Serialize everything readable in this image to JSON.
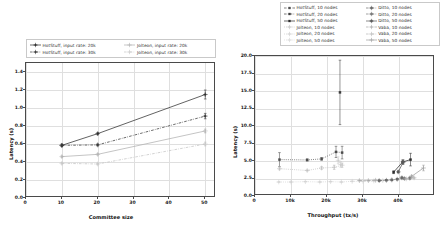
{
  "figure": {
    "panels": [
      "left-latency-vs-committee-size",
      "right-latency-vs-throughput"
    ]
  },
  "left_panel": {
    "legend": {
      "position": "above-axes",
      "columns": 2,
      "items": [
        {
          "label": "HotStuff, input rate: 20k",
          "marker": "plus-square",
          "color": "#2f2f2f",
          "dash": "solid"
        },
        {
          "label": "Jolteon, input rate: 20k",
          "marker": "plus",
          "color": "#b0b0b0",
          "dash": "solid"
        },
        {
          "label": "HotStuff, input rate: 30k",
          "marker": "plus-square",
          "color": "#3a3a3a",
          "dash": "dashdot"
        },
        {
          "label": "Jolteon, input rate: 30k",
          "marker": "plus",
          "color": "#c4c4c4",
          "dash": "dashdot"
        }
      ]
    },
    "chart_data": {
      "type": "line",
      "title": "",
      "xlabel": "Committee size",
      "ylabel": "Latency (s)",
      "xlim": [
        0,
        53
      ],
      "ylim": [
        0.0,
        1.5
      ],
      "grid": true,
      "xticks": [
        0,
        10,
        20,
        30,
        40,
        50
      ],
      "xticklabels": [
        "0",
        "10",
        "20",
        "30",
        "40",
        "50"
      ],
      "yticks": [
        0.0,
        0.2,
        0.4,
        0.6,
        0.8,
        1.0,
        1.2,
        1.4
      ],
      "yticklabels": [
        "0.0",
        "0.2",
        "0.4",
        "0.6",
        "0.8",
        "1.0",
        "1.2",
        "1.4"
      ],
      "x": [
        10,
        20,
        50
      ],
      "series": [
        {
          "name": "HotStuff, input rate: 20k",
          "values": [
            0.585,
            0.715,
            1.15
          ],
          "yerr": [
            0.012,
            0.012,
            0.05
          ],
          "color": "#2f2f2f",
          "dash": "solid",
          "marker": "plus-square"
        },
        {
          "name": "HotStuff, input rate: 30k",
          "values": [
            0.585,
            0.59,
            0.91
          ],
          "yerr": [
            0.012,
            0.012,
            0.03
          ],
          "color": "#3a3a3a",
          "dash": "dashdot",
          "marker": "plus-square"
        },
        {
          "name": "Jolteon, input rate: 20k",
          "values": [
            0.46,
            0.485,
            0.745
          ],
          "yerr": [
            0.01,
            0.01,
            0.02
          ],
          "color": "#b0b0b0",
          "dash": "solid",
          "marker": "plus"
        },
        {
          "name": "Jolteon, input rate: 30k",
          "values": [
            0.385,
            0.378,
            0.6
          ],
          "yerr": [
            0.01,
            0.01,
            0.02
          ],
          "color": "#c4c4c4",
          "dash": "dashdot",
          "marker": "plus"
        }
      ]
    }
  },
  "right_panel": {
    "legend": {
      "position": "above-axes",
      "columns": 2,
      "items": [
        {
          "label": "HotStuff, 10 nodes",
          "marker": "square",
          "color": "#4d4d4d",
          "dash": "dashed"
        },
        {
          "label": "Ditto, 10 nodes",
          "marker": "square-plus",
          "color": "#6a6a6a",
          "dash": "dashdot"
        },
        {
          "label": "HotStuff, 20 nodes",
          "marker": "square",
          "color": "#3c3c3c",
          "dash": "dashdot"
        },
        {
          "label": "Ditto, 20 nodes",
          "marker": "square-plus",
          "color": "#7a7a7a",
          "dash": "dashdot"
        },
        {
          "label": "HotStuff, 50 nodes",
          "marker": "square",
          "color": "#2b2b2b",
          "dash": "solid"
        },
        {
          "label": "Ditto, 50 nodes",
          "marker": "square-plus",
          "color": "#5a5a5a",
          "dash": "solid"
        },
        {
          "label": "Jolteon, 10 nodes",
          "marker": "plus",
          "color": "#bdbdbd",
          "dash": "dotted"
        },
        {
          "label": "Vaba, 10 nodes",
          "marker": "plus",
          "color": "#a8a8a8",
          "dash": "dashed"
        },
        {
          "label": "Jolteon, 20 nodes",
          "marker": "plus",
          "color": "#c9c9c9",
          "dash": "dotted"
        },
        {
          "label": "Vaba, 20 nodes",
          "marker": "plus",
          "color": "#b5b5b5",
          "dash": "dashdot"
        },
        {
          "label": "Jolteon, 50 nodes",
          "marker": "plus",
          "color": "#d2d2d2",
          "dash": "dotted"
        },
        {
          "label": "Vaba, 50 nodes",
          "marker": "plus",
          "color": "#9e9e9e",
          "dash": "solid"
        }
      ]
    },
    "chart_data": {
      "type": "scatter",
      "title": "",
      "xlabel": "Throughput (tx/s)",
      "ylabel": "Latency (s)",
      "xlim": [
        0,
        50000
      ],
      "ylim": [
        0.0,
        20.0
      ],
      "grid": true,
      "xticks": [
        0,
        10000,
        20000,
        30000,
        40000
      ],
      "xticklabels": [
        "0",
        "10k",
        "20k",
        "30k",
        "40k"
      ],
      "yticks": [
        0.0,
        2.5,
        5.0,
        7.5,
        10.0,
        12.5,
        15.0,
        17.5,
        20.0
      ],
      "yticklabels": [
        "0.0",
        "2.5",
        "5.0",
        "7.5",
        "10.0",
        "12.5",
        "15.0",
        "17.5",
        "20.0"
      ],
      "series": [
        {
          "name": "HotStuff, 10 nodes",
          "color": "#4d4d4d",
          "dash": "dotted",
          "marker": "square",
          "x": [
            6800,
            14500,
            18500,
            22500,
            24200
          ],
          "y": [
            5.2,
            5.15,
            5.3,
            6.3,
            6.2
          ],
          "yerr": [
            1.0,
            0.15,
            0.2,
            0.8,
            0.9
          ]
        },
        {
          "name": "HotStuff, 20 nodes",
          "color": "#3c3c3c",
          "dash": "dashdot",
          "marker": "square",
          "x": [
            23600
          ],
          "y": [
            14.8
          ],
          "yerr": [
            4.6
          ]
        },
        {
          "name": "HotStuff, 50 nodes",
          "color": "#2b2b2b",
          "dash": "solid",
          "marker": "square",
          "x": [
            38500,
            41000,
            43200
          ],
          "y": [
            3.4,
            4.85,
            5.2
          ],
          "yerr": [
            0.2,
            0.3,
            0.9
          ]
        },
        {
          "name": "Jolteon, 10 nodes",
          "color": "#bdbdbd",
          "dash": "dotted",
          "marker": "plus",
          "x": [
            6800,
            14500,
            18500,
            22000,
            24200
          ],
          "y": [
            3.9,
            3.65,
            4.0,
            4.1,
            4.4
          ],
          "yerr": [
            0.15,
            0.1,
            0.2,
            0.3,
            0.3
          ]
        },
        {
          "name": "Jolteon, 20 nodes",
          "color": "#c9c9c9",
          "dash": "dotted",
          "marker": "plus",
          "x": [
            23100,
            23800
          ],
          "y": [
            5.1,
            4.5
          ],
          "yerr": [
            0.5,
            0.4
          ]
        },
        {
          "name": "Jolteon, 50 nodes",
          "color": "#d2d2d2",
          "dash": "dotted",
          "marker": "plus",
          "x": [
            6600,
            10000,
            14000,
            18000,
            21000,
            24000,
            27000,
            30000,
            33000,
            35500
          ],
          "y": [
            2.0,
            2.0,
            2.05,
            2.0,
            2.05,
            2.0,
            2.1,
            2.1,
            2.15,
            2.2
          ],
          "yerr": [
            0.05,
            0.05,
            0.05,
            0.05,
            0.05,
            0.05,
            0.05,
            0.05,
            0.05,
            0.05
          ]
        },
        {
          "name": "Ditto, 10 nodes",
          "color": "#6a6a6a",
          "dash": "dashdot",
          "marker": "square-plus",
          "x": [
            34500,
            36500,
            38000,
            39500,
            40800
          ],
          "y": [
            2.2,
            2.25,
            2.3,
            2.4,
            2.6
          ],
          "yerr": [
            0.05,
            0.05,
            0.08,
            0.1,
            0.15
          ]
        },
        {
          "name": "Ditto, 20 nodes",
          "color": "#7a7a7a",
          "dash": "dashdot",
          "marker": "square-plus",
          "x": [
            41500,
            43000
          ],
          "y": [
            2.5,
            2.55
          ],
          "yerr": [
            0.1,
            0.15
          ]
        },
        {
          "name": "Ditto, 50 nodes",
          "color": "#5a5a5a",
          "dash": "solid",
          "marker": "square-plus",
          "x": [
            39800,
            41200
          ],
          "y": [
            3.45,
            4.85
          ],
          "yerr": [
            0.15,
            0.3
          ]
        },
        {
          "name": "Vaba, 10 nodes",
          "color": "#a8a8a8",
          "dash": "dashed",
          "marker": "plus",
          "x": [
            29000,
            31500,
            33500
          ],
          "y": [
            2.2,
            2.2,
            2.25
          ],
          "yerr": [
            0.05,
            0.05,
            0.05
          ]
        },
        {
          "name": "Vaba, 20 nodes",
          "color": "#b5b5b5",
          "dash": "dashdot",
          "marker": "plus",
          "x": [
            42000,
            44200
          ],
          "y": [
            2.45,
            2.6
          ],
          "yerr": [
            0.1,
            0.1
          ]
        },
        {
          "name": "Vaba, 50 nodes",
          "color": "#9e9e9e",
          "dash": "solid",
          "marker": "plus",
          "x": [
            43500,
            46800
          ],
          "y": [
            2.8,
            4.0
          ],
          "yerr": [
            0.15,
            0.4
          ]
        }
      ]
    }
  }
}
